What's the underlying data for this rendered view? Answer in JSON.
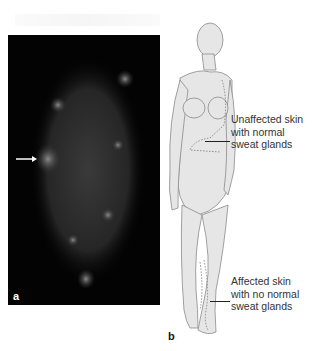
{
  "figure": {
    "panels": [
      {
        "id": "a",
        "label": "a",
        "description": "Dark thermographic/sweat-test image of torso with faint speckled glow and a bright spot marked by an arrow",
        "background_color": "#030303",
        "arrow": {
          "direction": "right",
          "color": "#ffffff"
        }
      },
      {
        "id": "b",
        "label": "b",
        "description": "Line drawing of a standing female figure with dashed outlines marking skin regions",
        "skin_color": "#e6e6e6"
      }
    ],
    "annotations": [
      {
        "id": "unaffected",
        "lines": [
          "Unaffected skin",
          "with normal",
          "sweat glands"
        ]
      },
      {
        "id": "affected",
        "lines": [
          "Affected skin",
          "with no normal",
          "sweat glands"
        ]
      }
    ],
    "colors": {
      "text": "#333333",
      "leader_line": "#222222",
      "panel_dark": "#030303"
    }
  }
}
